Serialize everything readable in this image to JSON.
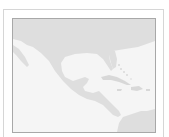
{
  "map": {
    "region": "Central America and Caribbean",
    "colors": {
      "land": "#dedede",
      "water": "#f5f5f5",
      "frame_outer": "#d6d6d6",
      "frame_inner": "#a8a8a8"
    }
  }
}
